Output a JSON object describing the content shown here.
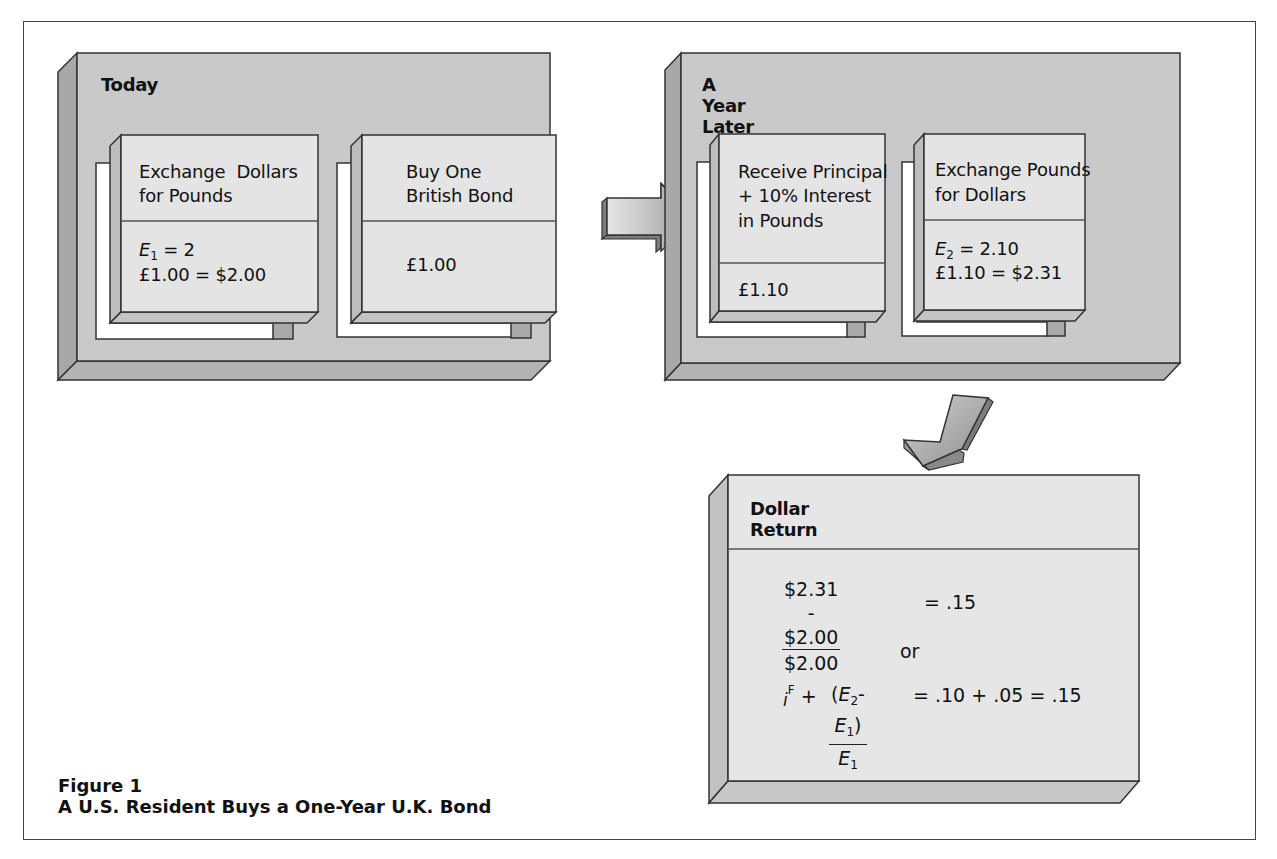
{
  "figure": {
    "label": "Figure 1",
    "title": "A U.S. Resident Buys a One-Year U.K. Bond"
  },
  "panels": {
    "today": {
      "title": "Today",
      "cards": [
        {
          "header_lines": [
            "Exchange  Dollars",
            "for Pounds"
          ],
          "body": {
            "var": "E",
            "sub": "1",
            "eq": " = 2",
            "line2": "£1.00 = $2.00"
          }
        },
        {
          "header_lines": [
            "Buy One",
            "British Bond"
          ],
          "body": {
            "line1": "£1.00"
          }
        }
      ]
    },
    "year_later": {
      "title": "A Year Later",
      "cards": [
        {
          "header_lines": [
            "Receive Principal",
            "+ 10% Interest",
            "in Pounds"
          ],
          "body": {
            "line1": "£1.10"
          }
        },
        {
          "header_lines": [
            "Exchange Pounds",
            "for Dollars"
          ],
          "body": {
            "var": "E",
            "sub": "2",
            "eq": " = 2.10",
            "line2": "£1.10 = $2.31"
          }
        }
      ]
    },
    "dollar_return": {
      "title": "Dollar Return",
      "formula1": {
        "numerator": "$2.31 - $2.00",
        "denominator": "$2.00",
        "result": "= .15"
      },
      "connector": "or",
      "formula2": {
        "prefix_i": "i",
        "prefix_sup": "F",
        "plus": "+",
        "num_open": "(",
        "num_e2": "E",
        "num_e2_sub": "2",
        "num_minus": "- ",
        "num_e1": "E",
        "num_e1_sub": "1",
        "num_close": ")",
        "den_e": "E",
        "den_sub": "1",
        "result": "= .10 + .05 = .15"
      }
    }
  },
  "arrows": [
    {
      "name": "arrow-right",
      "direction": "right"
    },
    {
      "name": "arrow-down-left",
      "direction": "down-left"
    }
  ],
  "colors": {
    "panel_face": "#c9c9c9",
    "panel_side": "#a8a8a8",
    "card_face": "#e4e4e4",
    "card_side": "#bdbdbd",
    "tab": "#a9a9a9",
    "outline": "#333333"
  }
}
